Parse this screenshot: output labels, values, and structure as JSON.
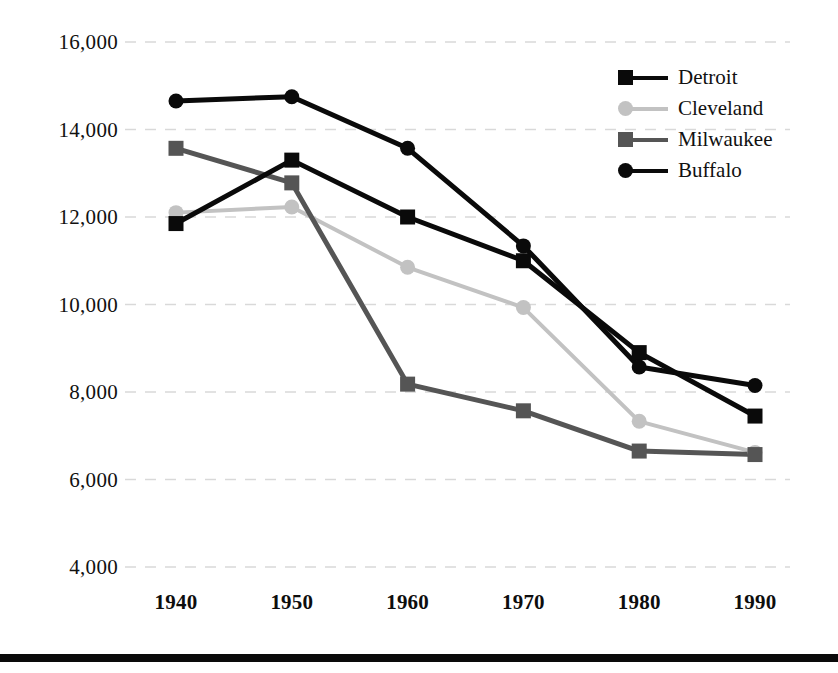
{
  "chart_data": {
    "type": "line",
    "title": "",
    "subtitle": "",
    "xlabel": "",
    "ylabel": "",
    "categories": [
      "1940",
      "1950",
      "1960",
      "1970",
      "1980",
      "1990"
    ],
    "x": [
      1940,
      1950,
      1960,
      1970,
      1980,
      1990
    ],
    "xlim": [
      1935,
      1995
    ],
    "ylim": [
      4000,
      16000
    ],
    "yticks": [
      16000,
      14000,
      12000,
      10000,
      8000,
      6000,
      4000
    ],
    "ytick_labels": [
      "16,000",
      "14,000",
      "12,000",
      "10,000",
      "8,000",
      "6,000",
      "4,000"
    ],
    "grid": "horizontal-dashed",
    "legend_position": "top-right",
    "series": [
      {
        "name": "Detroit",
        "marker": "square",
        "color": "#0a0a0a",
        "values": [
          11850,
          13300,
          12000,
          11000,
          8900,
          7450
        ]
      },
      {
        "name": "Cleveland",
        "marker": "circle",
        "color": "#c2c2c2",
        "values": [
          12100,
          12230,
          10850,
          9930,
          7330,
          6620
        ]
      },
      {
        "name": "Milwaukee",
        "marker": "square",
        "color": "#555555",
        "values": [
          13570,
          12780,
          8180,
          7570,
          6650,
          6570
        ]
      },
      {
        "name": "Buffalo",
        "marker": "circle",
        "color": "#0a0a0a",
        "values": [
          14650,
          14750,
          13570,
          11340,
          8570,
          8150
        ]
      }
    ]
  },
  "legend": {
    "items": [
      {
        "label": "Detroit"
      },
      {
        "label": "Cleveland"
      },
      {
        "label": "Milwaukee"
      },
      {
        "label": "Buffalo"
      }
    ]
  },
  "colors": {
    "gridline": "#d9d9d9",
    "background": "#ffffff",
    "text": "#111111",
    "rule": "#0a0a0a"
  }
}
